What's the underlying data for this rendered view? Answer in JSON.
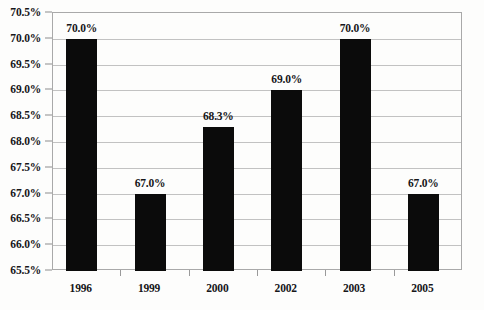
{
  "chart_data": {
    "type": "bar",
    "title": "",
    "subtitle": "",
    "xlabel": "",
    "ylabel": "",
    "categories": [
      "1996",
      "1999",
      "2000",
      "2002",
      "2003",
      "2005"
    ],
    "values": [
      70.0,
      67.0,
      68.3,
      69.0,
      70.0,
      67.0
    ],
    "data_labels": [
      "70.0%",
      "67.0%",
      "68.3%",
      "69.0%",
      "70.0%",
      "67.0%"
    ],
    "ylim": [
      65.5,
      70.5
    ],
    "ytick_step": 0.5,
    "ytick_labels": [
      "70.5%",
      "70.0%",
      "69.5%",
      "69.0%",
      "68.5%",
      "68.0%",
      "67.5%",
      "67.0%",
      "66.5%",
      "66.0%",
      "65.5%"
    ],
    "ytick_values": [
      70.5,
      70.0,
      69.5,
      69.0,
      68.5,
      68.0,
      67.5,
      67.0,
      66.5,
      66.0,
      65.5
    ],
    "grid": true,
    "legend": null,
    "bar_color": "#0b0b0b",
    "gridline_color": "#c2c2c2",
    "axis_color": "#a9a9a9",
    "background_color": "#fdfdfc",
    "text_color": "#17171a"
  }
}
